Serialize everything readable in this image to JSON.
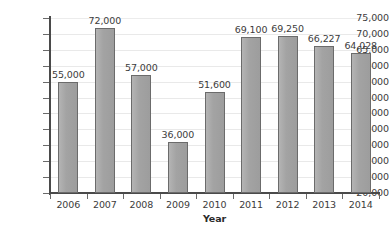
{
  "chart_data": {
    "type": "bar",
    "title": "",
    "xlabel": "Year",
    "ylabel": "",
    "categories": [
      "2006",
      "2007",
      "2008",
      "2009",
      "2010",
      "2011",
      "2012",
      "2013",
      "2014"
    ],
    "values": [
      55000,
      72000,
      57000,
      36000,
      51600,
      69100,
      69250,
      66227,
      64028
    ],
    "data_labels": [
      "55,000",
      "72,000",
      "57,000",
      "36,000",
      "51,600",
      "69,100",
      "69,250",
      "66,227",
      "64,028"
    ],
    "ylim": [
      20000,
      75000
    ],
    "ytick_values": [
      20000,
      25000,
      30000,
      35000,
      40000,
      45000,
      50000,
      55000,
      60000,
      65000,
      70000,
      75000
    ],
    "ytick_labels": [
      "20,000",
      "25,000",
      "30,000",
      "35,000",
      "40,000",
      "45,000",
      "50,000",
      "55,000",
      "60,000",
      "65,000",
      "70,000",
      "75,000"
    ],
    "grid": true,
    "legend": "none",
    "bar_color": "#a8a8a8",
    "bar_border_color": "#6b6b6b",
    "gridline_color": "#e9e9e9",
    "axis_color": "#4a4a4a",
    "text_color": "#3c3c3c"
  }
}
